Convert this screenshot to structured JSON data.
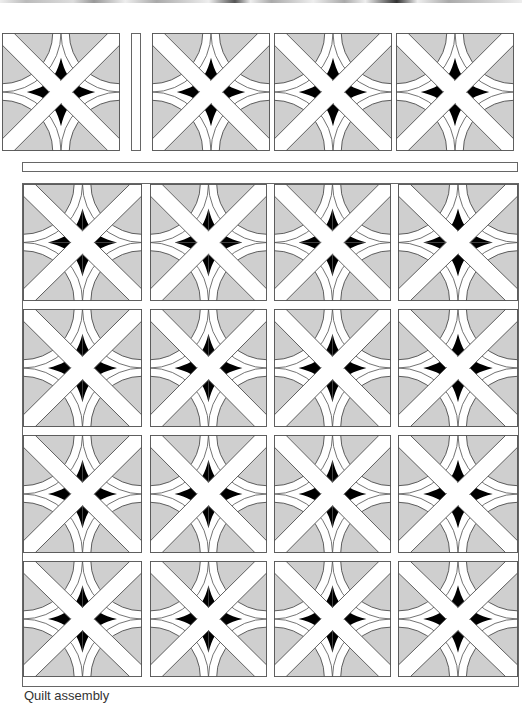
{
  "figure": {
    "colors": {
      "background": "#cfcfcf",
      "band": "#ffffff",
      "star": "#000000",
      "outline": "#555555"
    },
    "top_row": {
      "blocks": 4,
      "separator_strip": "vertical sashing strip"
    },
    "horizontal_strip": "horizontal sashing strip",
    "main_grid": {
      "rows": 4,
      "columns": 4,
      "blocks": 16
    },
    "caption": "Quilt assembly"
  }
}
